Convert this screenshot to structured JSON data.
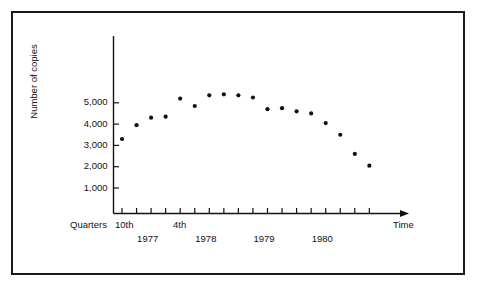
{
  "figure": {
    "border_color": "#1a1a1a",
    "background": "#ffffff",
    "ink_color": "#111111"
  },
  "axis": {
    "y_title": "Number of copies",
    "x_title": "Time",
    "quarters_label": "Quarters",
    "first_quarter_label": "10th",
    "fourth_quarter_label": "4th",
    "y_ticks": [
      "1,000",
      "2,000",
      "3,000",
      "4,000",
      "5,000"
    ],
    "year_labels": [
      "1977",
      "1978",
      "1979",
      "1980"
    ]
  },
  "chart_data": {
    "type": "scatter",
    "title": "",
    "xlabel": "Time",
    "ylabel": "Number of copies",
    "ylim": [
      0,
      6500
    ],
    "y_ticks": [
      1000,
      2000,
      3000,
      4000,
      5000
    ],
    "y_tick_labels": [
      "1,000",
      "2,000",
      "3,000",
      "4,000",
      "5,000"
    ],
    "grid": false,
    "legend": "none",
    "x_tick_count": 18,
    "x_axis_note": "Quarters; 10th quarter marked at first point, 4th quarter marked at fourth tick; years 1977, 1978, 1979, 1980 span groups of four quarters",
    "categories": [
      "1977 Q10",
      "1977 Q11",
      "1977 Q12",
      "1978 Q4",
      "1978 Q5",
      "1978 Q6",
      "1978 Q7",
      "1978 Q8",
      "1979 Q9",
      "1979 Q10",
      "1979 Q11",
      "1979 Q12",
      "1980 Q13",
      "1980 Q14",
      "1980 Q15",
      "1980 Q16",
      "1980 Q17",
      "1980 Q18"
    ],
    "x": [
      1,
      2,
      3,
      4,
      5,
      6,
      7,
      8,
      9,
      10,
      11,
      12,
      13,
      14,
      15,
      16,
      17,
      18
    ],
    "values": [
      3300,
      3950,
      4300,
      4350,
      5200,
      4850,
      5350,
      5400,
      5350,
      5250,
      4700,
      4750,
      4600,
      4500,
      4050,
      3500,
      2600,
      2050
    ],
    "annotations": [
      {
        "text": "Quarters",
        "position": "below-axis-left"
      },
      {
        "text": "10th",
        "position": "first-tick"
      },
      {
        "text": "4th",
        "position": "fourth-tick"
      },
      {
        "text": "Time",
        "position": "axis-arrow-end"
      }
    ]
  }
}
